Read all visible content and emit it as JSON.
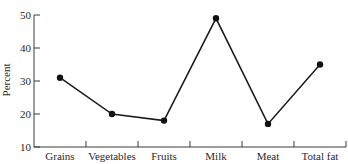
{
  "chart_data": {
    "type": "line",
    "title": "",
    "xlabel": "",
    "ylabel": "Percent",
    "categories": [
      "Grains",
      "Vegetables",
      "Fruits",
      "Milk",
      "Meat",
      "Total fat"
    ],
    "values": [
      31,
      20,
      18,
      49,
      17,
      35
    ],
    "ylim": [
      10,
      50
    ],
    "yticks": [
      10,
      20,
      30,
      40,
      50
    ],
    "grid": false,
    "legend": null,
    "markers": true,
    "colors": {
      "line": "#1a1a1a",
      "marker": "#111111",
      "axis": "#3a3a3a",
      "text": "#2a2a2a"
    }
  }
}
